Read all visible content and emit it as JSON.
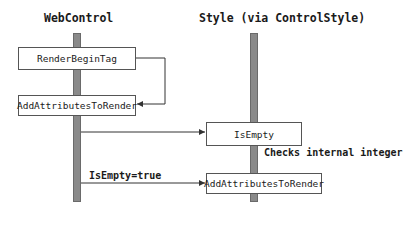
{
  "diagram": {
    "type": "sequence",
    "participants": [
      {
        "id": "webcontrol",
        "label": "WebControl"
      },
      {
        "id": "style",
        "label": "Style (via ControlStyle)"
      }
    ],
    "calls": [
      {
        "id": "render_begin_tag",
        "participant": "webcontrol",
        "label": "RenderBeginTag"
      },
      {
        "id": "add_attributes_left",
        "participant": "webcontrol",
        "label": "AddAttributesToRender"
      },
      {
        "id": "is_empty",
        "participant": "style",
        "label": "IsEmpty"
      },
      {
        "id": "add_attributes_right",
        "participant": "style",
        "label": "AddAttributesToRender"
      }
    ],
    "messages": [
      {
        "from": "render_begin_tag",
        "to": "add_attributes_left",
        "label": ""
      },
      {
        "from": "webcontrol",
        "to": "is_empty",
        "label": ""
      },
      {
        "from": "webcontrol",
        "to": "add_attributes_right",
        "label": "IsEmpty=true"
      }
    ],
    "annotations": [
      {
        "near": "is_empty",
        "text": "Checks internal integer"
      }
    ],
    "colors": {
      "lifeline_fill": "#8a8a8a",
      "box_border": "#555555",
      "line": "#333333",
      "background": "#ffffff"
    }
  }
}
